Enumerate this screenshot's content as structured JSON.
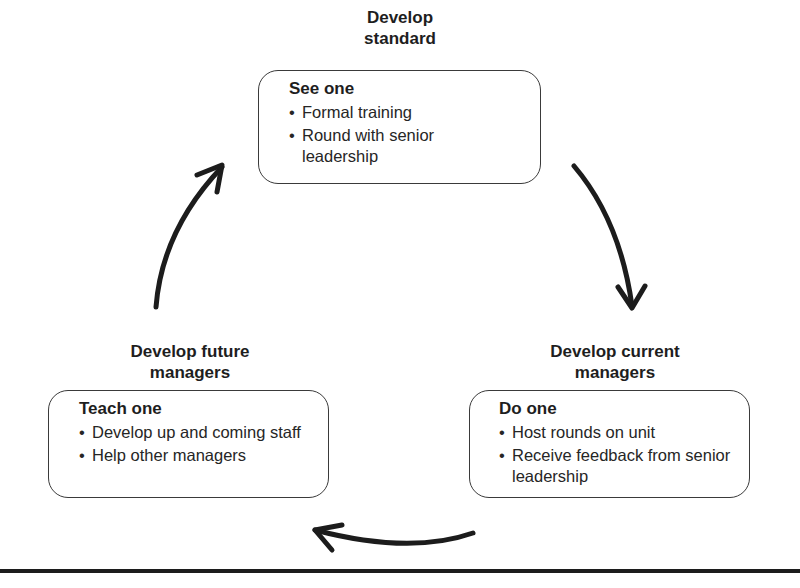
{
  "diagram": {
    "type": "cycle",
    "stages": [
      {
        "id": "top",
        "title_lines": [
          "Develop",
          "standard"
        ],
        "box_heading": "See one",
        "bullets": [
          "Formal training",
          "Round with senior leadership"
        ]
      },
      {
        "id": "right",
        "title_lines": [
          "Develop current",
          "managers"
        ],
        "box_heading": "Do one",
        "bullets": [
          "Host rounds on unit",
          "Receive feedback from senior leadership"
        ]
      },
      {
        "id": "left",
        "title_lines": [
          "Develop future",
          "managers"
        ],
        "box_heading": "Teach one",
        "bullets": [
          "Develop up and coming staff",
          "Help other managers"
        ]
      }
    ],
    "arrows": [
      {
        "from": "top",
        "to": "right",
        "icon": "curved-arrow-down-right"
      },
      {
        "from": "right",
        "to": "left",
        "icon": "curved-arrow-left"
      },
      {
        "from": "left",
        "to": "top",
        "icon": "curved-arrow-up-right"
      }
    ],
    "bullet_glyph": "•",
    "colors": {
      "ink": "#1c1c1c",
      "box_border": "#3a3a3a",
      "background": "#ffffff"
    }
  }
}
